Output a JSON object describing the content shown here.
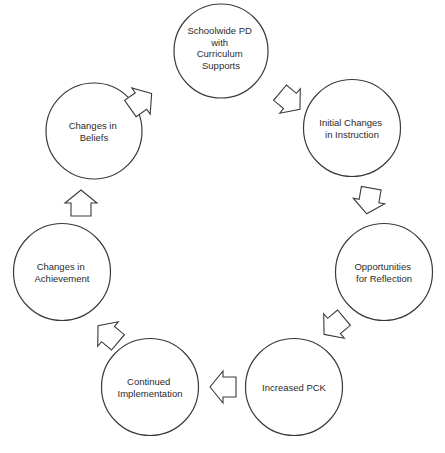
{
  "diagram": {
    "type": "cycle",
    "colors": {
      "background": "#ffffff",
      "stroke": "#3a3a3a",
      "text": "#2b2b2b"
    },
    "nodes": [
      {
        "id": "schoolwide-pd",
        "lines": [
          "Schoolwide PD",
          "with",
          "Curriculum",
          "Supports"
        ]
      },
      {
        "id": "initial-changes",
        "lines": [
          "Initial Changes",
          "in Instruction"
        ]
      },
      {
        "id": "opportunities",
        "lines": [
          "Opportunities",
          "for Reflection"
        ]
      },
      {
        "id": "increased-pck",
        "lines": [
          "Increased PCK"
        ]
      },
      {
        "id": "continued-implementation",
        "lines": [
          "Continued",
          "Implementation"
        ]
      },
      {
        "id": "changes-achievement",
        "lines": [
          "Changes in",
          "Achievement"
        ]
      },
      {
        "id": "changes-beliefs",
        "lines": [
          "Changes in",
          "Beliefs"
        ]
      }
    ],
    "edges": [
      {
        "from": "schoolwide-pd",
        "to": "initial-changes",
        "icon": "block-arrow-icon"
      },
      {
        "from": "initial-changes",
        "to": "opportunities",
        "icon": "block-arrow-icon"
      },
      {
        "from": "opportunities",
        "to": "increased-pck",
        "icon": "block-arrow-icon"
      },
      {
        "from": "increased-pck",
        "to": "continued-implementation",
        "icon": "block-arrow-icon"
      },
      {
        "from": "continued-implementation",
        "to": "changes-achievement",
        "icon": "block-arrow-icon"
      },
      {
        "from": "changes-achievement",
        "to": "changes-beliefs",
        "icon": "block-arrow-icon"
      },
      {
        "from": "changes-beliefs",
        "to": "schoolwide-pd",
        "icon": "block-arrow-icon"
      }
    ]
  }
}
